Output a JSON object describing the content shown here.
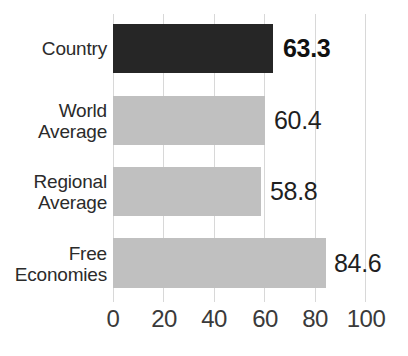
{
  "chart_data": {
    "type": "bar",
    "orientation": "horizontal",
    "title": "",
    "subtitle": "",
    "xlabel": "",
    "ylabel": "",
    "xlim": [
      0,
      100
    ],
    "ylim": null,
    "grid": "vertical",
    "legend": "none",
    "xticks": [
      "0",
      "20",
      "40",
      "60",
      "80",
      "100"
    ],
    "xtick_values": [
      0,
      20,
      40,
      60,
      80,
      100
    ],
    "categories": [
      "Country",
      "World Average",
      "Regional Average",
      "Free Economies"
    ],
    "values": [
      63.3,
      60.4,
      58.8,
      84.6
    ],
    "value_labels": [
      "63.3",
      "60.4",
      "58.8",
      "84.6"
    ],
    "colors": [
      "#262626",
      "#c0c0c0",
      "#c0c0c0",
      "#c0c0c0"
    ],
    "highlight_index": 0,
    "bars": [
      {
        "category": "Country",
        "category_lines": [
          "Country"
        ],
        "value": 63.3,
        "value_label": "63.3",
        "color": "#262626",
        "emphasis": "bold"
      },
      {
        "category": "World Average",
        "category_lines": [
          "World",
          "Average"
        ],
        "value": 60.4,
        "value_label": "60.4",
        "color": "#c0c0c0",
        "emphasis": "normal"
      },
      {
        "category": "Regional Average",
        "category_lines": [
          "Regional",
          "Average"
        ],
        "value": 58.8,
        "value_label": "58.8",
        "color": "#c0c0c0",
        "emphasis": "normal"
      },
      {
        "category": "Free Economies",
        "category_lines": [
          "Free",
          "Economies"
        ],
        "value": 84.6,
        "value_label": "84.6",
        "color": "#c0c0c0",
        "emphasis": "normal"
      }
    ]
  },
  "style": {
    "background": "#ffffff",
    "gridline_color": "#d8d8d8",
    "text_color": "#2b2b2b",
    "tick_color": "#3a3a3a",
    "highlight_color": "#262626",
    "bar_color": "#c0c0c0"
  },
  "axis": {
    "tick_0": "0",
    "tick_20": "20",
    "tick_40": "40",
    "tick_60": "60",
    "tick_80": "80",
    "tick_100": "100"
  },
  "labels": {
    "cat_0_line_0": "Country",
    "cat_1_line_0": "World",
    "cat_1_line_1": "Average",
    "cat_2_line_0": "Regional",
    "cat_2_line_1": "Average",
    "cat_3_line_0": "Free",
    "cat_3_line_1": "Economies",
    "val_0": "63.3",
    "val_1": "60.4",
    "val_2": "58.8",
    "val_3": "84.6"
  }
}
